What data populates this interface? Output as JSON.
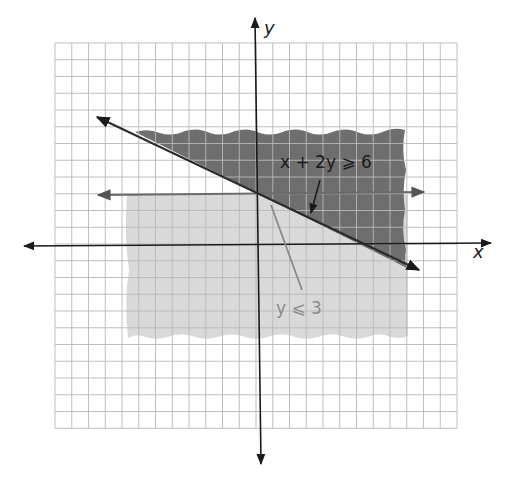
{
  "chart_data": {
    "type": "line",
    "title": "",
    "xlabel": "x",
    "ylabel": "y",
    "xlim": [
      -12,
      12
    ],
    "ylim": [
      -11,
      12
    ],
    "grid": true,
    "grid_step": 1,
    "series": [
      {
        "name": "x + 2y ≥ 6",
        "kind": "boundary-line",
        "equation": "x + 2y = 6",
        "points": [
          [
            -10,
            8
          ],
          [
            10,
            -2
          ]
        ],
        "shading": "above",
        "shade_region": {
          "x": [
            -7.5,
            9
          ],
          "y": [
            -1.5,
            7
          ]
        },
        "color": "#555555"
      },
      {
        "name": "y ≤ 3",
        "kind": "boundary-line",
        "equation": "y = 3",
        "points": [
          [
            -10,
            3
          ],
          [
            10,
            3
          ]
        ],
        "shading": "below",
        "shade_region": {
          "x": [
            -8,
            9
          ],
          "y": [
            -5.5,
            3
          ]
        },
        "color": "#9a9a9a"
      }
    ],
    "annotations": [
      {
        "text": "x + 2y ⩾ 6",
        "pointer_to": [
          3.3,
          1.35
        ]
      },
      {
        "text": "y ⩽ 3",
        "pointer_to": [
          0.8,
          2.6
        ]
      }
    ]
  },
  "labels": {
    "x_axis": "x",
    "y_axis": "y",
    "ineq1": "x + 2y ⩾ 6",
    "ineq2": "y ⩽ 3"
  },
  "colors": {
    "dark_shade": "#6e6e6e",
    "light_shade": "#d9d9d9",
    "grid": "#b8b8b8",
    "axis": "#1a1a1a",
    "line1": "#2a2a2a",
    "line2": "#6a6a6a",
    "label2": "#8a8a8a"
  }
}
